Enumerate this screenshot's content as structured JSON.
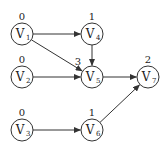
{
  "diagram": {
    "type": "directed-graph",
    "nodes": [
      {
        "id": "V1",
        "letter": "V",
        "sub": "1",
        "rank": "0",
        "cx": 22,
        "cy": 34,
        "rx": 22,
        "ry": 20
      },
      {
        "id": "V2",
        "letter": "V",
        "sub": "2",
        "rank": "0",
        "cx": 22,
        "cy": 77,
        "rx": 22,
        "ry": 63
      },
      {
        "id": "V3",
        "letter": "V",
        "sub": "3",
        "rank": "0",
        "cx": 22,
        "cy": 130,
        "rx": 22,
        "ry": 116
      },
      {
        "id": "V4",
        "letter": "V",
        "sub": "4",
        "rank": "1",
        "cx": 92,
        "cy": 34,
        "rx": 92,
        "ry": 20
      },
      {
        "id": "V5",
        "letter": "V",
        "sub": "5",
        "rank": "3",
        "cx": 92,
        "cy": 77,
        "rx": 78,
        "ry": 65
      },
      {
        "id": "V6",
        "letter": "V",
        "sub": "6",
        "rank": "1",
        "cx": 92,
        "cy": 130,
        "rx": 92,
        "ry": 116
      },
      {
        "id": "V7",
        "letter": "V",
        "sub": "7",
        "rank": "2",
        "cx": 148,
        "cy": 77,
        "rx": 148,
        "ry": 63
      }
    ],
    "edges": [
      {
        "from": "V1",
        "to": "V4"
      },
      {
        "from": "V1",
        "to": "V5"
      },
      {
        "from": "V4",
        "to": "V5"
      },
      {
        "from": "V2",
        "to": "V5"
      },
      {
        "from": "V5",
        "to": "V7"
      },
      {
        "from": "V3",
        "to": "V6"
      },
      {
        "from": "V6",
        "to": "V7"
      }
    ],
    "node_radius": 11,
    "colors": {
      "stroke": "#333333",
      "text": "#222222",
      "background": "#ffffff"
    }
  }
}
